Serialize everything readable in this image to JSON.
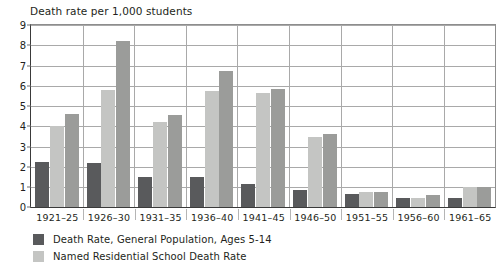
{
  "chart_data": {
    "type": "bar",
    "title": "Death rate per 1,000 students",
    "xlabel": "",
    "ylabel": "",
    "ylim": [
      0,
      9
    ],
    "ytick_step": 1,
    "grid": true,
    "legend_position": "below-left",
    "categories": [
      "1921–25",
      "1926–30",
      "1931–35",
      "1936–40",
      "1941–45",
      "1946–50",
      "1951–55",
      "1956–60",
      "1961–65"
    ],
    "yticks": [
      "0",
      "1",
      "2",
      "3",
      "4",
      "5",
      "6",
      "7",
      "8",
      "9"
    ],
    "series": [
      {
        "name": "Death Rate, General Population, Ages 5-14",
        "color": "#595a5c",
        "values": [
          2.2,
          2.18,
          1.48,
          1.47,
          1.15,
          0.85,
          0.65,
          0.45,
          0.43
        ]
      },
      {
        "name": "Named Residential School Death Rate",
        "color": "#c4c5c3",
        "values": [
          4.02,
          5.78,
          4.18,
          5.73,
          5.62,
          3.45,
          0.72,
          0.46,
          0.98
        ]
      },
      {
        "name": "",
        "color": "#9b9c9a",
        "values": [
          4.58,
          8.17,
          4.52,
          6.72,
          5.83,
          3.58,
          0.75,
          0.58,
          0.98
        ]
      }
    ]
  },
  "legend": {
    "entries": [
      {
        "label": "Death Rate, General Population, Ages 5-14",
        "color": "#595a5c",
        "swatch_name": "legend-swatch-general-population"
      },
      {
        "label": "Named Residential School Death Rate",
        "color": "#c4c5c3",
        "swatch_name": "legend-swatch-residential-school"
      }
    ]
  },
  "colors": {
    "axis": "#3a3a3a",
    "grid": "#a9a9a9",
    "text": "#231f20",
    "background": "#ffffff"
  }
}
